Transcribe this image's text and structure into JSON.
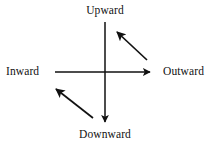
{
  "diagram": {
    "background_color": "#ffffff",
    "stroke_color": "#111111",
    "labels": {
      "up": "Upward",
      "down": "Downward",
      "left": "Inward",
      "right": "Outward"
    },
    "axes": [
      {
        "name": "vertical-axis",
        "from": [
          105,
          22
        ],
        "to": [
          105,
          122
        ],
        "arrowhead": "end"
      },
      {
        "name": "horizontal-axis",
        "from": [
          55,
          72
        ],
        "to": [
          150,
          72
        ],
        "arrowhead": "end"
      }
    ],
    "diagonal_arrows": [
      {
        "name": "upper-right-diagonal-arrow",
        "from": [
          147,
          60
        ],
        "to": [
          117,
          32
        ],
        "direction": "up-left"
      },
      {
        "name": "lower-left-diagonal-arrow",
        "from": [
          93,
          118
        ],
        "to": [
          56,
          89
        ],
        "direction": "up-left"
      }
    ]
  }
}
